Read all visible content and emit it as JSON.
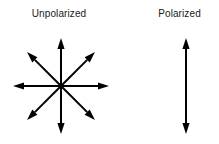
{
  "figure": {
    "title_left": "Unpolarized",
    "title_right": "Polarized",
    "background_color": "#ffffff",
    "line_color": "#000000",
    "text_color": "#1a1a1a"
  },
  "chart_data": {
    "type": "diagram",
    "title": "",
    "panels": [
      {
        "name": "unpolarized",
        "label": "Unpolarized",
        "label_center_x": 58,
        "label_baseline_y": 20,
        "symbol": "eight-direction double-headed arrow starburst",
        "center": [
          61,
          86
        ],
        "radius": 48,
        "arrow_count": 8,
        "axis_count": 4,
        "axis_angles_deg": [
          0,
          45,
          90,
          135
        ],
        "arrow_angles_deg": [
          0,
          45,
          90,
          135,
          180,
          225,
          270,
          315
        ],
        "double_headed": true,
        "meaning": "electric field vibrates in all directions perpendicular to propagation"
      },
      {
        "name": "polarized",
        "label": "Polarized",
        "label_center_x": 189,
        "label_baseline_y": 20,
        "symbol": "single vertical double-headed arrow",
        "center": [
          186,
          86
        ],
        "half_length": 48,
        "arrow_count": 2,
        "axis_count": 1,
        "axis_angles_deg": [
          90
        ],
        "arrow_angles_deg": [
          90,
          270
        ],
        "double_headed": true,
        "meaning": "electric field vibrates in a single plane"
      }
    ],
    "style": {
      "stroke_width_px": 2,
      "arrowhead_length_px": 11,
      "arrowhead_half_width_px": 3.6,
      "grid": false,
      "legend": false
    }
  }
}
